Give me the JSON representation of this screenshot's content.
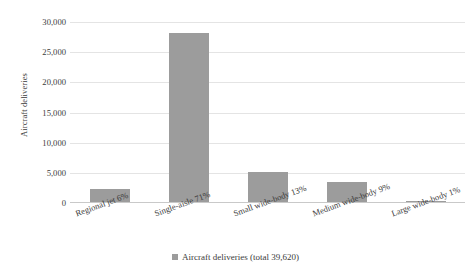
{
  "chart_data": {
    "type": "bar",
    "title": "",
    "subtitle": "",
    "xlabel": "",
    "ylabel": "Aircraft deliveries",
    "categories": [
      "Regional jet 6%",
      "Single-aisle 71%",
      "Small wide-body 13%",
      "Medium wide-body 9%",
      "Large wide-body 1%"
    ],
    "values": [
      2377,
      28130,
      5151,
      3566,
      396
    ],
    "series": [
      {
        "name": "Aircraft deliveries (total 39,620)",
        "values": [
          2377,
          28130,
          5151,
          3566,
          396
        ]
      }
    ],
    "percentages": [
      6,
      71,
      13,
      9,
      1
    ],
    "total": 39620,
    "ylim": [
      0,
      30000
    ],
    "ytick_values": [
      0,
      5000,
      10000,
      15000,
      20000,
      25000,
      30000
    ],
    "ytick_labels": [
      "0",
      "5,000",
      "10,000",
      "15,000",
      "20,000",
      "25,000",
      "30,000"
    ],
    "grid": true,
    "grid_axis": "y",
    "legend_position": "bottom",
    "bar_color": "#9c9c9c",
    "gridline_color": "#e4e4e4",
    "text_color": "#3b3b3b"
  },
  "legend": {
    "label": "Aircraft deliveries (total 39,620)",
    "swatch_name": "legend-color-swatch"
  }
}
